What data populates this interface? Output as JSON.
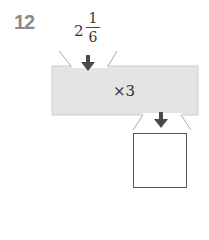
{
  "problem": {
    "number": "12",
    "input": {
      "whole": "2",
      "numerator": "1",
      "denominator": "6"
    },
    "operation": "×3",
    "answer": ""
  },
  "colors": {
    "machine_fill": "#e4e4e4",
    "arrow": "#4a4a4a",
    "number": "#8a8a8a",
    "funnel_line": "#aaaaaa"
  }
}
